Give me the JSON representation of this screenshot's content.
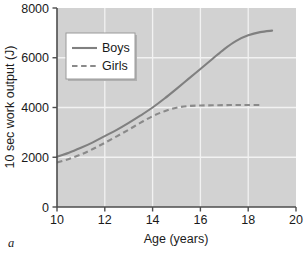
{
  "panel": {
    "label": "a"
  },
  "colors": {
    "plot_background": "#d2d2d2",
    "gridline": "#f2f2f2",
    "axis": "#4d4d4d",
    "series_boys": "#808080",
    "series_girls": "#8a8a8a",
    "legend_background": "#ffffff",
    "legend_border": "#9a9a9a",
    "text": "#1a1a1a"
  },
  "chart_data": {
    "type": "line",
    "title": "",
    "xlabel": "Age (years)",
    "ylabel": "10 sec work output (J)",
    "xlim": [
      10,
      20
    ],
    "ylim": [
      0,
      8000
    ],
    "xticks": [
      10,
      12,
      14,
      16,
      18,
      20
    ],
    "yticks": [
      0,
      2000,
      4000,
      6000,
      8000
    ],
    "xtick_labels": [
      "10",
      "12",
      "14",
      "16",
      "18",
      "20"
    ],
    "ytick_labels": [
      "0",
      "2000",
      "4000",
      "6000",
      "8000"
    ],
    "grid": true,
    "grid_color": "#f2f2f2",
    "legend_position": "upper left",
    "series": [
      {
        "name": "Boys",
        "style": "solid",
        "color": "#808080",
        "x": [
          10.0,
          10.5,
          11.0,
          11.5,
          12.0,
          12.5,
          13.0,
          13.5,
          14.0,
          14.5,
          15.0,
          15.5,
          16.0,
          16.5,
          17.0,
          17.5,
          18.0,
          18.5,
          19.0
        ],
        "values": [
          2020,
          2180,
          2380,
          2600,
          2850,
          3100,
          3380,
          3680,
          4000,
          4360,
          4750,
          5150,
          5550,
          5950,
          6350,
          6680,
          6900,
          7030,
          7090
        ]
      },
      {
        "name": "Girls",
        "style": "dashed",
        "color": "#8a8a8a",
        "x": [
          10.0,
          10.5,
          11.0,
          11.5,
          12.0,
          12.5,
          13.0,
          13.5,
          14.0,
          14.5,
          15.0,
          15.5,
          16.0,
          16.5,
          17.0,
          17.5,
          18.0,
          18.6
        ],
        "values": [
          1790,
          1930,
          2110,
          2330,
          2580,
          2840,
          3110,
          3390,
          3650,
          3850,
          3990,
          4060,
          4080,
          4090,
          4095,
          4100,
          4100,
          4100
        ]
      }
    ]
  },
  "legend": {
    "entries": [
      {
        "label": "Boys",
        "style": "solid"
      },
      {
        "label": "Girls",
        "style": "dashed"
      }
    ]
  }
}
